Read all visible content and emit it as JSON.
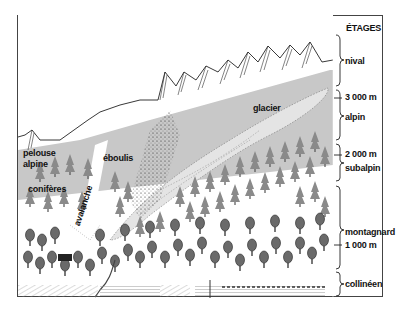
{
  "diagram": {
    "type": "altitudinal-vegetation-zones",
    "header": "ÉTAGES",
    "zones": [
      {
        "name": "nival",
        "label": "nival"
      },
      {
        "name": "alpin",
        "label": "alpin"
      },
      {
        "name": "subalpin",
        "label": "subalpin"
      },
      {
        "name": "montagnard",
        "label": "montagnard"
      },
      {
        "name": "collineen",
        "label": "collinéen"
      }
    ],
    "altitudes": [
      {
        "value": "3 000 m"
      },
      {
        "value": "2 000 m"
      },
      {
        "value": "1 000 m"
      }
    ],
    "annotations": {
      "glacier": "glacier",
      "eboulis": "éboulis",
      "pelouse_line1": "pelouse",
      "pelouse_line2": "alpine",
      "coniferes": "conifères",
      "avalanche": "avalanche",
      "feuillus": "feuillus"
    },
    "colors": {
      "frame": "#444444",
      "alpine_meadow": "#c8c8c8",
      "glacier": "#e4e4e4",
      "conifer": "#8a8a8a",
      "deciduous": "#6a6a6a",
      "ink": "#111111"
    }
  }
}
